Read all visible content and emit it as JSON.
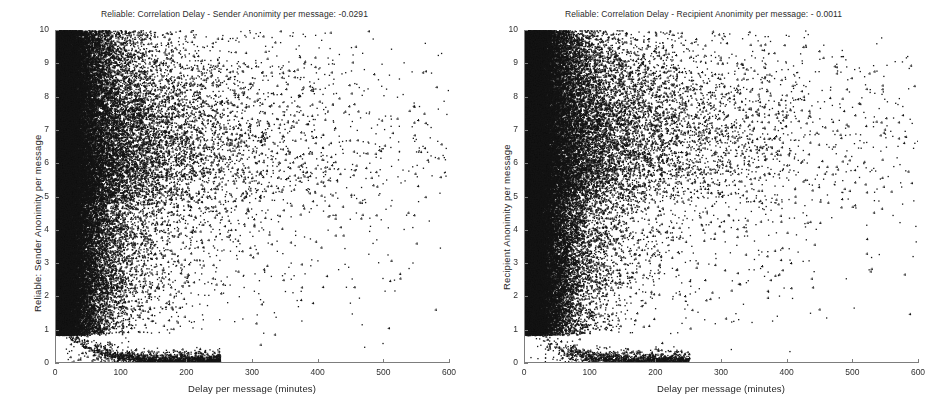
{
  "figure": {
    "width": 939,
    "height": 405,
    "background": "#ffffff",
    "marker_color": "#141414"
  },
  "chart_data": [
    {
      "type": "scatter",
      "id": "sender-anonimity-scatter",
      "title": "Reliable: Correlation Delay - Sender Anonimity per message:  -0.0291",
      "correlation": -0.0291,
      "xlabel": "Delay per message (minutes)",
      "ylabel": "Reliable: Sender Anonimity per message",
      "xlim": [
        0,
        600
      ],
      "ylim": [
        0,
        10
      ],
      "xticks": [
        0,
        100,
        200,
        300,
        400,
        500,
        600
      ],
      "yticks": [
        0,
        1,
        2,
        3,
        4,
        5,
        6,
        7,
        8,
        9,
        10
      ],
      "xtick_labels": [
        "0",
        "100",
        "200",
        "300",
        "400",
        "500",
        "600"
      ],
      "ytick_labels": [
        "0",
        "1",
        "2",
        "3",
        "4",
        "5",
        "6",
        "7",
        "8",
        "9",
        "10"
      ],
      "grid": false,
      "legend": "none",
      "marker": "plus",
      "marker_size": 1.6,
      "n_points": 26000,
      "density_model": {
        "seed": 1187,
        "clusters": [
          {
            "weight": 0.5,
            "x_mode": "exp",
            "x_scale": 42,
            "x_min": 0,
            "y_mode": "uniform",
            "y_min": 0.9,
            "y_max": 10.0
          },
          {
            "weight": 0.2,
            "x_mode": "exp",
            "x_scale": 78,
            "x_min": 0,
            "y_mode": "uniform",
            "y_min": 2.0,
            "y_max": 10.0
          },
          {
            "weight": 0.13,
            "x_mode": "exp",
            "x_scale": 120,
            "x_min": 0,
            "y_mode": "normal",
            "y_mean": 7.1,
            "y_sd": 1.5
          },
          {
            "weight": 0.07,
            "x_mode": "exp",
            "x_scale": 165,
            "x_min": 20,
            "y_mode": "normal",
            "y_mean": 6.4,
            "y_sd": 2.2
          },
          {
            "weight": 0.04,
            "x_mode": "exp",
            "x_scale": 210,
            "x_min": 40,
            "y_mode": "uniform",
            "y_min": 1.0,
            "y_max": 9.5
          },
          {
            "weight": 0.06,
            "x_mode": "arc",
            "x_scale": 115,
            "y_mode": "arc"
          }
        ]
      }
    },
    {
      "type": "scatter",
      "id": "recipient-anonimity-scatter",
      "title": "Reliable: Correlation Delay - Recipient Anonimity per message:  - 0.0011",
      "correlation": -0.0011,
      "xlabel": "Delay per message (minutes)",
      "ylabel": "Recipient Anonimity per message",
      "xlim": [
        0,
        600
      ],
      "ylim": [
        0,
        10
      ],
      "xticks": [
        0,
        100,
        200,
        300,
        400,
        500,
        600
      ],
      "yticks": [
        0,
        1,
        2,
        3,
        4,
        5,
        6,
        7,
        8,
        9,
        10
      ],
      "xtick_labels": [
        "0",
        "100",
        "200",
        "300",
        "400",
        "500",
        "600"
      ],
      "ytick_labels": [
        "0",
        "1",
        "2",
        "3",
        "4",
        "5",
        "6",
        "7",
        "8",
        "9",
        "10"
      ],
      "grid": false,
      "legend": "none",
      "marker": "plus",
      "marker_size": 1.6,
      "n_points": 26000,
      "density_model": {
        "seed": 7741,
        "clusters": [
          {
            "weight": 0.48,
            "x_mode": "exp",
            "x_scale": 40,
            "x_min": 0,
            "y_mode": "uniform",
            "y_min": 0.9,
            "y_max": 10.0
          },
          {
            "weight": 0.21,
            "x_mode": "exp",
            "x_scale": 80,
            "x_min": 0,
            "y_mode": "uniform",
            "y_min": 2.0,
            "y_max": 10.0
          },
          {
            "weight": 0.14,
            "x_mode": "exp",
            "x_scale": 125,
            "x_min": 0,
            "y_mode": "normal",
            "y_mean": 7.6,
            "y_sd": 1.3
          },
          {
            "weight": 0.08,
            "x_mode": "exp",
            "x_scale": 175,
            "x_min": 20,
            "y_mode": "normal",
            "y_mean": 6.8,
            "y_sd": 2.1
          },
          {
            "weight": 0.04,
            "x_mode": "exp",
            "x_scale": 215,
            "x_min": 40,
            "y_mode": "uniform",
            "y_min": 1.0,
            "y_max": 9.5
          },
          {
            "weight": 0.05,
            "x_mode": "arc",
            "x_scale": 110,
            "y_mode": "arc"
          }
        ]
      }
    }
  ]
}
